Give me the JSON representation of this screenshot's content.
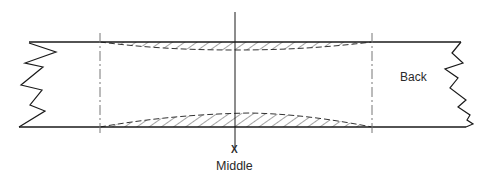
{
  "diagram": {
    "type": "technical cross-section sketch",
    "labels": {
      "back": "Back",
      "middle_marker": "X",
      "middle": "Middle"
    },
    "colors": {
      "line": "#1a1a1a",
      "hatch": "#555555",
      "guide": "#777777",
      "background": "#ffffff"
    },
    "elements": [
      {
        "name": "top-edge-line",
        "description": "horizontal solid line at top"
      },
      {
        "name": "bottom-edge-line",
        "description": "horizontal solid line at bottom"
      },
      {
        "name": "left-break-zigzag",
        "description": "irregular break line on left end"
      },
      {
        "name": "right-break-zigzag",
        "description": "irregular break line on right end (Back)"
      },
      {
        "name": "left-guide-line",
        "description": "dash-dot vertical guide on left"
      },
      {
        "name": "right-guide-line",
        "description": "dash-dot vertical guide on right"
      },
      {
        "name": "middle-axis-line",
        "description": "solid vertical center line"
      },
      {
        "name": "top-hatched-region",
        "description": "hatched lens-shaped region under top edge"
      },
      {
        "name": "bottom-hatched-region",
        "description": "hatched lens-shaped region above bottom edge"
      }
    ]
  }
}
